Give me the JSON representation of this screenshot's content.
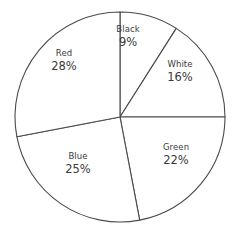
{
  "chart_data": {
    "type": "pie",
    "title": "",
    "subtitle": "",
    "xlabel": "",
    "ylabel": "",
    "legend_position": "none",
    "grid": false,
    "start_angle_deg": 0,
    "direction": "clockwise",
    "categories": [
      "Black",
      "White",
      "Green",
      "Blue",
      "Red"
    ],
    "values": [
      9,
      16,
      22,
      25,
      28
    ],
    "value_unit": "%",
    "total": 100,
    "slices": [
      {
        "label": "Black",
        "value": 9,
        "value_text": "9%",
        "start_deg": 0,
        "end_deg": 32.4,
        "fill": "#ffffff",
        "stroke": "#4a4a4a",
        "label_x": 128,
        "label_y": 37
      },
      {
        "label": "White",
        "value": 16,
        "value_text": "16%",
        "start_deg": 32.4,
        "end_deg": 90,
        "fill": "#ffffff",
        "stroke": "#4a4a4a",
        "label_x": 180,
        "label_y": 72
      },
      {
        "label": "Green",
        "value": 22,
        "value_text": "22%",
        "start_deg": 90,
        "end_deg": 169.2,
        "fill": "#ffffff",
        "stroke": "#4a4a4a",
        "label_x": 176,
        "label_y": 155
      },
      {
        "label": "Blue",
        "value": 25,
        "value_text": "25%",
        "start_deg": 169.2,
        "end_deg": 259.2,
        "fill": "#ffffff",
        "stroke": "#4a4a4a",
        "label_x": 78,
        "label_y": 164
      },
      {
        "label": "Red",
        "value": 28,
        "value_text": "28%",
        "start_deg": 259.2,
        "end_deg": 360,
        "fill": "#ffffff",
        "stroke": "#4a4a4a",
        "label_x": 64,
        "label_y": 61
      }
    ],
    "geometry": {
      "center_x": 120,
      "center_y": 117,
      "radius": 105
    }
  }
}
